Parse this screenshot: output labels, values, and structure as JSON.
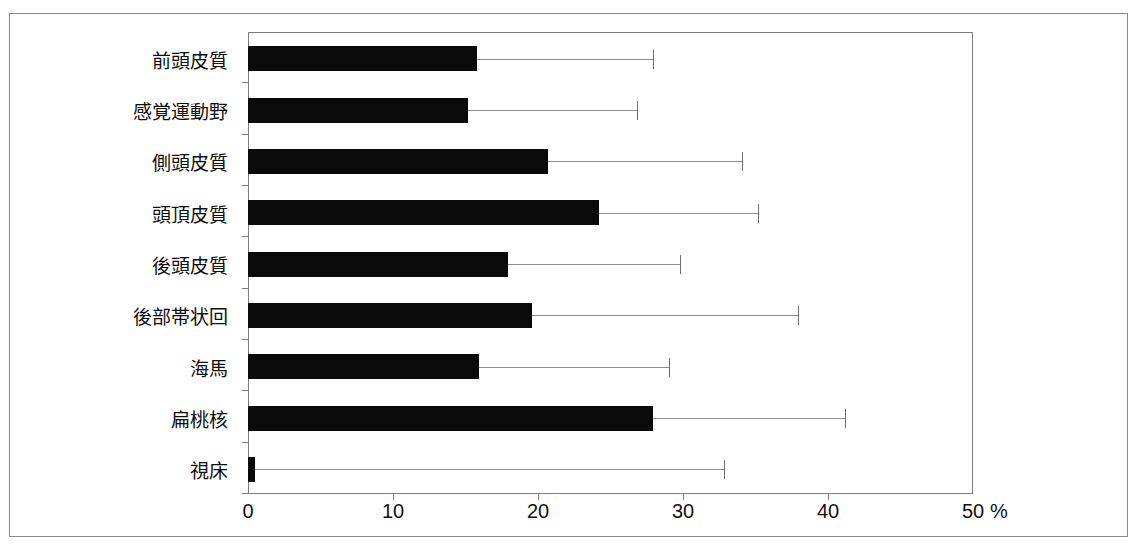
{
  "chart_data": {
    "type": "bar",
    "orientation": "horizontal",
    "title": "",
    "xlabel": "%",
    "ylabel": "",
    "xlim": [
      0,
      50
    ],
    "xticks": [
      0,
      10,
      20,
      30,
      40,
      50
    ],
    "xtick_labels": [
      "0",
      "10",
      "20",
      "30",
      "40",
      "50"
    ],
    "unit_suffix": "%",
    "grid": false,
    "legend": false,
    "error_bars": "upper-only",
    "categories": [
      "前頭皮質",
      "感覚運動野",
      "側頭皮質",
      "頭頂皮質",
      "後頭皮質",
      "後部帯状回",
      "海馬",
      "扁桃核",
      "視床"
    ],
    "values": [
      15.8,
      15.2,
      20.7,
      24.2,
      17.9,
      19.6,
      15.9,
      27.9,
      0.5
    ],
    "error_upper": [
      27.9,
      26.8,
      34.1,
      35.2,
      29.8,
      37.9,
      29.0,
      41.2,
      32.8
    ],
    "bar_color": "#0a0a0a",
    "error_color": "#8d8d8d",
    "frame_color": "#7d7d7d"
  }
}
